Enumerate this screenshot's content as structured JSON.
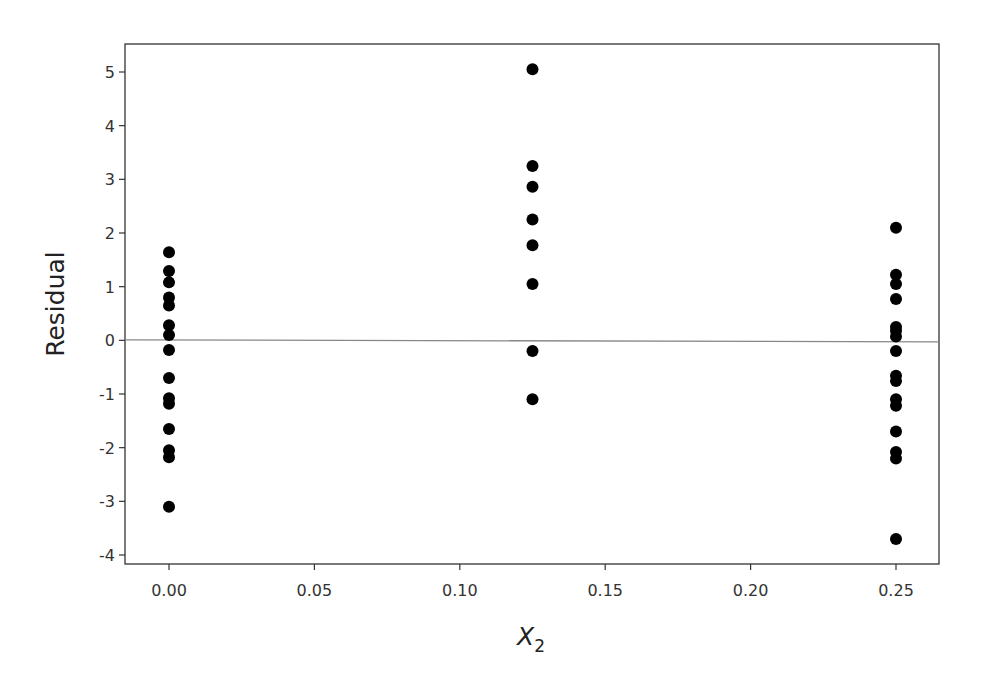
{
  "chart_data": {
    "type": "scatter",
    "title": "",
    "xlabel": "X",
    "xlabel_subscript": "2",
    "ylabel": "Residual",
    "xlim": [
      -0.015,
      0.265
    ],
    "ylim": [
      -4.15,
      5.55
    ],
    "grid": false,
    "legend": null,
    "x_ticks": [
      0.0,
      0.05,
      0.1,
      0.15,
      0.2,
      0.25
    ],
    "x_tick_labels": [
      "0.00",
      "0.05",
      "0.10",
      "0.15",
      "0.20",
      "0.25"
    ],
    "y_ticks": [
      -4,
      -3,
      -2,
      -1,
      0,
      1,
      2,
      3,
      4,
      5
    ],
    "y_tick_labels": [
      "-4",
      "-3",
      "-2",
      "-1",
      "0",
      "1",
      "2",
      "3",
      "4",
      "5"
    ],
    "reference_line": {
      "y": 0,
      "color": "#888888"
    },
    "marker_color": "#000000",
    "series": [
      {
        "name": "X2 = 0.00",
        "points": [
          {
            "x": 0.0,
            "y": 1.64
          },
          {
            "x": 0.0,
            "y": 1.29
          },
          {
            "x": 0.0,
            "y": 1.08
          },
          {
            "x": 0.0,
            "y": 0.8
          },
          {
            "x": 0.0,
            "y": 0.65
          },
          {
            "x": 0.0,
            "y": 0.28
          },
          {
            "x": 0.0,
            "y": 0.1
          },
          {
            "x": 0.0,
            "y": -0.18
          },
          {
            "x": 0.0,
            "y": -0.7
          },
          {
            "x": 0.0,
            "y": -1.08
          },
          {
            "x": 0.0,
            "y": -1.18
          },
          {
            "x": 0.0,
            "y": -1.65
          },
          {
            "x": 0.0,
            "y": -2.05
          },
          {
            "x": 0.0,
            "y": -2.18
          },
          {
            "x": 0.0,
            "y": -3.1
          }
        ]
      },
      {
        "name": "X2 = 0.125",
        "points": [
          {
            "x": 0.125,
            "y": 5.05
          },
          {
            "x": 0.125,
            "y": 3.25
          },
          {
            "x": 0.125,
            "y": 2.86
          },
          {
            "x": 0.125,
            "y": 2.25
          },
          {
            "x": 0.125,
            "y": 1.77
          },
          {
            "x": 0.125,
            "y": 1.05
          },
          {
            "x": 0.125,
            "y": -0.2
          },
          {
            "x": 0.125,
            "y": -1.1
          }
        ]
      },
      {
        "name": "X2 = 0.25",
        "points": [
          {
            "x": 0.25,
            "y": 2.1
          },
          {
            "x": 0.25,
            "y": 1.22
          },
          {
            "x": 0.25,
            "y": 1.05
          },
          {
            "x": 0.25,
            "y": 0.77
          },
          {
            "x": 0.25,
            "y": 0.25
          },
          {
            "x": 0.25,
            "y": 0.18
          },
          {
            "x": 0.25,
            "y": 0.07
          },
          {
            "x": 0.25,
            "y": -0.2
          },
          {
            "x": 0.25,
            "y": -0.66
          },
          {
            "x": 0.25,
            "y": -0.76
          },
          {
            "x": 0.25,
            "y": -1.1
          },
          {
            "x": 0.25,
            "y": -1.22
          },
          {
            "x": 0.25,
            "y": -1.7
          },
          {
            "x": 0.25,
            "y": -2.08
          },
          {
            "x": 0.25,
            "y": -2.2
          },
          {
            "x": 0.25,
            "y": -3.7
          }
        ]
      }
    ]
  }
}
